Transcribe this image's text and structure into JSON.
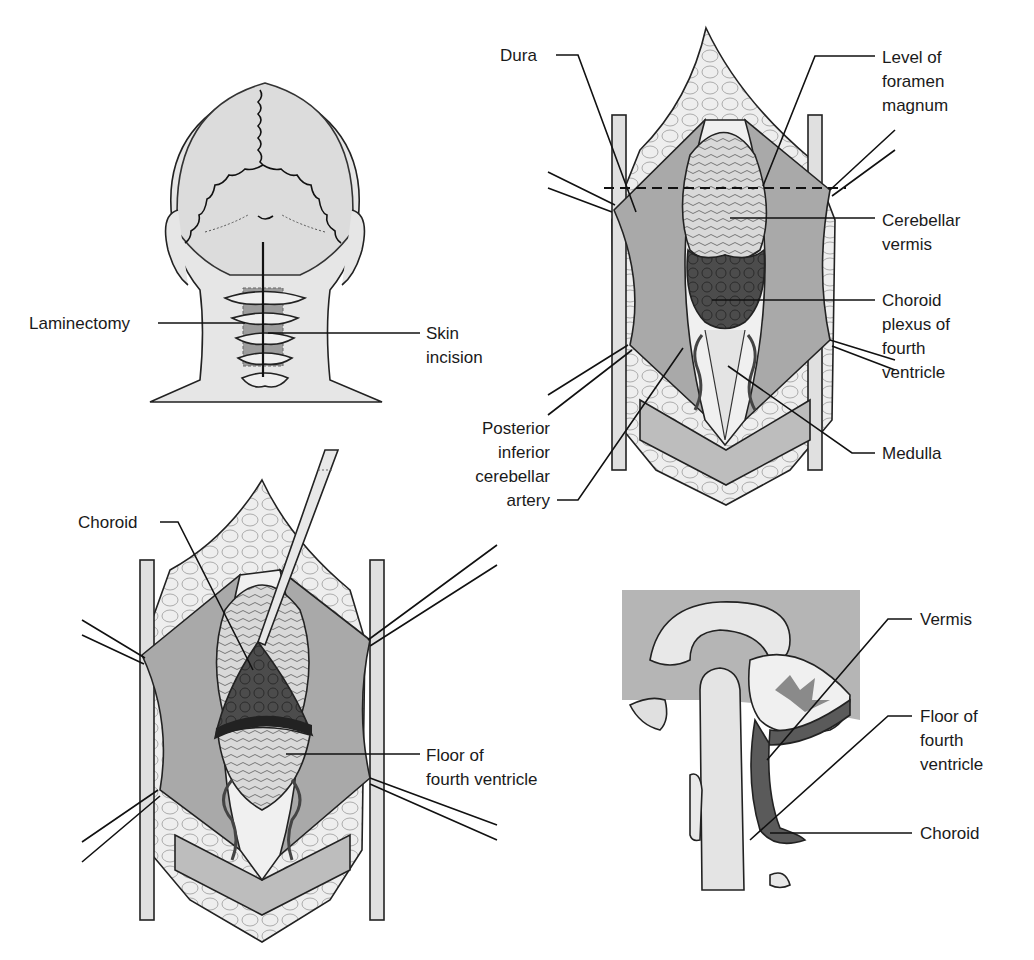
{
  "figure": {
    "panels": [
      {
        "id": "head-posterior-view",
        "labels": [
          {
            "lines": [
              "Laminectomy"
            ]
          },
          {
            "lines": [
              "Skin",
              "incision"
            ]
          }
        ]
      },
      {
        "id": "dura-opened",
        "labels": [
          {
            "lines": [
              "Dura"
            ]
          },
          {
            "lines": [
              "Level of",
              "foramen",
              "magnum"
            ]
          },
          {
            "lines": [
              "Cerebellar",
              "vermis"
            ]
          },
          {
            "lines": [
              "Choroid",
              "plexus of",
              "fourth",
              "ventricle"
            ]
          },
          {
            "lines": [
              "Posterior",
              "inferior",
              "cerebellar",
              "artery"
            ]
          },
          {
            "lines": [
              "Medulla"
            ]
          }
        ]
      },
      {
        "id": "choroid-retracted",
        "labels": [
          {
            "lines": [
              "Choroid"
            ]
          },
          {
            "lines": [
              "Floor of",
              "fourth ventricle"
            ]
          }
        ]
      },
      {
        "id": "sagittal-section",
        "labels": [
          {
            "lines": [
              "Vermis"
            ]
          },
          {
            "lines": [
              "Floor of",
              "fourth",
              "ventricle"
            ]
          },
          {
            "lines": [
              "Choroid"
            ]
          }
        ]
      }
    ],
    "colors": {
      "skin": "#e6e6e6",
      "dura": "#a9a9a9",
      "tissue": "#d2d2d2",
      "choroid": "#4a4a4a",
      "background_gray": "#b5b5b5",
      "line": "#111111"
    }
  }
}
